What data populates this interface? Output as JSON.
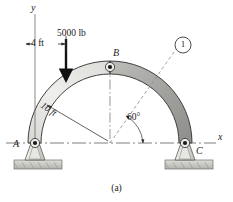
{
  "figure": {
    "caption": "(a)",
    "axes": {
      "y_label": "y",
      "x_label": "x"
    },
    "points": [
      {
        "id": "A",
        "label": "A",
        "type": "pin-support"
      },
      {
        "id": "B",
        "label": "B",
        "type": "pin-joint"
      },
      {
        "id": "C",
        "label": "C",
        "type": "pin-support"
      }
    ],
    "annotations": {
      "load_label": "5000 lb",
      "dimension_label": "4 ft",
      "radius_label": "10 ft",
      "angle_label": "60°",
      "callout_label": "1"
    },
    "colors": {
      "arch_left_fill": "#e8e8e6",
      "arch_right_fill": "#a8a8a6",
      "outline": "#3a3a3a",
      "ground_fill": "#c9c9c4",
      "centerline": "#6b6b6b",
      "text": "#1a1a1a"
    }
  }
}
